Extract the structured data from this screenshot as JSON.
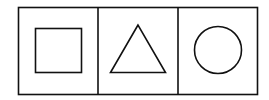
{
  "diagram": {
    "stroke_color": "#111111",
    "background": "#ffffff",
    "panels": [
      {
        "shape": "square",
        "label": "square"
      },
      {
        "shape": "triangle",
        "label": "triangle"
      },
      {
        "shape": "circle",
        "label": "circle"
      }
    ]
  }
}
